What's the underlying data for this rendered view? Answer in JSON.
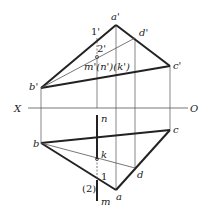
{
  "axis": {
    "left_label": "X",
    "right_label": "O"
  },
  "front_view": {
    "a": "a'",
    "b": "b'",
    "c": "c'",
    "d": "d'",
    "p1": "1'",
    "p2": "2'",
    "mnk": "m'(n')(k')"
  },
  "top_view": {
    "a": "a",
    "b": "b",
    "c": "c",
    "d": "d",
    "n": "n",
    "k": "k",
    "m": "m",
    "p1": "1",
    "p2": "(2)"
  },
  "colors": {
    "line": "#222222",
    "thin": "#555555",
    "background": "#ffffff"
  }
}
